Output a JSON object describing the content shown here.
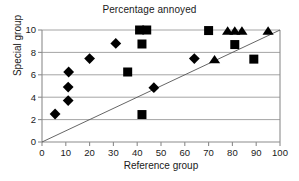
{
  "chart_data": {
    "type": "scatter",
    "title": "Percentage annoyed",
    "xlabel": "Reference group",
    "ylabel": "Special group",
    "xlim": [
      0,
      100
    ],
    "ylim": [
      0,
      10
    ],
    "xticks": [
      0,
      10,
      20,
      30,
      40,
      50,
      60,
      70,
      80,
      90,
      100
    ],
    "yticks": [
      0,
      2,
      4,
      6,
      8,
      10
    ],
    "xticklabels": [
      "0",
      "10",
      "20",
      "30",
      "40",
      "50",
      "60",
      "70",
      "80",
      "90",
      "100"
    ],
    "yticklabels": [
      "0",
      "2",
      "4",
      "6",
      "8",
      "10"
    ],
    "grid": "horizontal",
    "grid_color": "#9a9a9a",
    "axis_color": "#8c8c8c",
    "marker_color": "#000000",
    "legend": "none",
    "reference_line": {
      "label": "1:1 line",
      "x": [
        0,
        100
      ],
      "y": [
        0,
        10
      ],
      "color": "#555555"
    },
    "series": [
      {
        "name": "diamond",
        "marker": "diamond",
        "points": [
          {
            "x": 5.5,
            "y": 2.5
          },
          {
            "x": 11.0,
            "y": 3.7
          },
          {
            "x": 11.0,
            "y": 4.9
          },
          {
            "x": 11.2,
            "y": 6.25
          },
          {
            "x": 20.0,
            "y": 7.45
          },
          {
            "x": 31.0,
            "y": 8.8
          },
          {
            "x": 47.0,
            "y": 4.85
          },
          {
            "x": 64.0,
            "y": 7.45
          }
        ]
      },
      {
        "name": "square",
        "marker": "square",
        "points": [
          {
            "x": 41.0,
            "y": 10.0
          },
          {
            "x": 44.0,
            "y": 10.0
          },
          {
            "x": 42.0,
            "y": 8.75
          },
          {
            "x": 36.0,
            "y": 6.25
          },
          {
            "x": 42.0,
            "y": 2.45
          },
          {
            "x": 70.0,
            "y": 9.95
          },
          {
            "x": 81.0,
            "y": 8.7
          },
          {
            "x": 89.0,
            "y": 7.4
          }
        ]
      },
      {
        "name": "triangle",
        "marker": "triangle",
        "points": [
          {
            "x": 72.5,
            "y": 7.4
          },
          {
            "x": 78.0,
            "y": 9.95
          },
          {
            "x": 81.0,
            "y": 9.95
          },
          {
            "x": 84.0,
            "y": 9.95
          },
          {
            "x": 95.0,
            "y": 9.95
          }
        ]
      }
    ]
  }
}
